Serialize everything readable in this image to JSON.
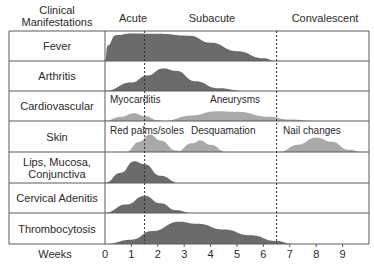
{
  "header": {
    "column_title_line1": "Clinical",
    "column_title_line2": "Manifestations",
    "phases": [
      {
        "label": "Acute",
        "x": 133
      },
      {
        "label": "Subacute",
        "x": 212
      },
      {
        "label": "Convalescent",
        "x": 320
      }
    ]
  },
  "axis": {
    "label": "Weeks",
    "ticks": [
      "0",
      "1",
      "2",
      "3",
      "4",
      "5",
      "6",
      "7",
      "8",
      "9"
    ],
    "week0_x": 105,
    "px_per_week": 26.4
  },
  "colors": {
    "dark_fill": "#6b6b6b",
    "light_fill": "#a9a9a9",
    "grid": "#5a5a5a",
    "dash": "#333333"
  },
  "dividers": [
    {
      "name": "acute-subacute-divider",
      "week": 1.5
    },
    {
      "name": "subacute-convalescent-divider",
      "week": 6.5
    }
  ],
  "rows": [
    {
      "label": "Fever",
      "top": 31,
      "bottom": 61
    },
    {
      "label": "Arthritis",
      "top": 61,
      "bottom": 91
    },
    {
      "label": "Cardiovascular",
      "top": 91,
      "bottom": 121
    },
    {
      "label": "Skin",
      "top": 121,
      "bottom": 152
    },
    {
      "label": "Lips, Mucosa,\nConjunctiva",
      "label_line1": "Lips, Mucosa,",
      "label_line2": "Conjunctiva",
      "top": 152,
      "bottom": 183
    },
    {
      "label": "Cervical Adenitis",
      "top": 183,
      "bottom": 213
    },
    {
      "label": "Thrombocytosis",
      "top": 213,
      "bottom": 244
    }
  ],
  "annotations": {
    "myocarditis": "Myocarditis",
    "aneurysms": "Aneurysms",
    "red_palms_soles": "Red palms/soles",
    "desquamation": "Desquamation",
    "nail_changes": "Nail changes"
  },
  "chart_data": {
    "type": "area",
    "xlabel": "Weeks",
    "ylabel": "Clinical Manifestations",
    "x_range": [
      0,
      10
    ],
    "x_ticks": [
      0,
      1,
      2,
      3,
      4,
      5,
      6,
      7,
      8,
      9
    ],
    "phases": [
      {
        "name": "Acute",
        "weeks": [
          0,
          1.5
        ]
      },
      {
        "name": "Subacute",
        "weeks": [
          1.5,
          6.5
        ]
      },
      {
        "name": "Convalescent",
        "weeks": [
          6.5,
          10
        ]
      }
    ],
    "series": [
      {
        "name": "Fever",
        "shade": "dark",
        "points": [
          [
            0,
            0
          ],
          [
            0.1,
            0.55
          ],
          [
            0.4,
            0.92
          ],
          [
            1,
            0.98
          ],
          [
            2,
            0.97
          ],
          [
            3.2,
            0.9
          ],
          [
            4,
            0.65
          ],
          [
            5,
            0.35
          ],
          [
            6,
            0.1
          ],
          [
            6.5,
            0
          ]
        ]
      },
      {
        "name": "Arthritis",
        "shade": "dark",
        "points": [
          [
            0,
            0
          ],
          [
            1,
            0.3
          ],
          [
            1.6,
            0.55
          ],
          [
            2.2,
            0.8
          ],
          [
            2.7,
            0.72
          ],
          [
            3.4,
            0.35
          ],
          [
            4.3,
            0.1
          ],
          [
            5.3,
            0
          ]
        ]
      },
      {
        "name": "Cardiovascular - Myocarditis",
        "shade": "light",
        "points": [
          [
            0,
            0
          ],
          [
            0.6,
            0.15
          ],
          [
            1.1,
            0.28
          ],
          [
            1.5,
            0.18
          ],
          [
            2,
            0.03
          ],
          [
            2.3,
            0
          ]
        ]
      },
      {
        "name": "Cardiovascular - Aneurysms",
        "shade": "light",
        "points": [
          [
            2.2,
            0
          ],
          [
            3.3,
            0.2
          ],
          [
            4.2,
            0.35
          ],
          [
            5,
            0.33
          ],
          [
            6.2,
            0.15
          ],
          [
            7,
            0.05
          ],
          [
            8,
            0
          ]
        ]
      },
      {
        "name": "Skin - Red palms/soles",
        "shade": "light",
        "points": [
          [
            0.8,
            0
          ],
          [
            1.3,
            0.35
          ],
          [
            1.7,
            0.6
          ],
          [
            2.1,
            0.4
          ],
          [
            2.7,
            0.05
          ],
          [
            3,
            0
          ]
        ]
      },
      {
        "name": "Skin - Desquamation",
        "shade": "light",
        "points": [
          [
            2.7,
            0
          ],
          [
            3.3,
            0.3
          ],
          [
            3.6,
            0.4
          ],
          [
            4,
            0.25
          ],
          [
            4.6,
            0
          ]
        ]
      },
      {
        "name": "Skin - Nail changes",
        "shade": "light",
        "points": [
          [
            6.6,
            0
          ],
          [
            7.3,
            0.25
          ],
          [
            8,
            0.5
          ],
          [
            8.6,
            0.35
          ],
          [
            9.2,
            0.08
          ],
          [
            9.8,
            0
          ]
        ]
      },
      {
        "name": "Lips, Mucosa, Conjunctiva",
        "shade": "dark",
        "points": [
          [
            0,
            0
          ],
          [
            0.6,
            0.35
          ],
          [
            1.1,
            0.75
          ],
          [
            1.5,
            0.65
          ],
          [
            2.1,
            0.25
          ],
          [
            2.8,
            0
          ]
        ]
      },
      {
        "name": "Cervical Adenitis",
        "shade": "dark",
        "points": [
          [
            0,
            0
          ],
          [
            0.8,
            0.3
          ],
          [
            1.5,
            0.62
          ],
          [
            2.1,
            0.35
          ],
          [
            2.7,
            0.1
          ],
          [
            3.3,
            0
          ]
        ]
      },
      {
        "name": "Thrombocytosis",
        "shade": "dark",
        "points": [
          [
            0,
            0
          ],
          [
            1,
            0.15
          ],
          [
            1.8,
            0.45
          ],
          [
            2.8,
            0.77
          ],
          [
            3.5,
            0.7
          ],
          [
            4.5,
            0.5
          ],
          [
            5.5,
            0.3
          ],
          [
            6.5,
            0.1
          ],
          [
            7.1,
            0
          ]
        ]
      }
    ],
    "grid": true,
    "legend": "none"
  }
}
